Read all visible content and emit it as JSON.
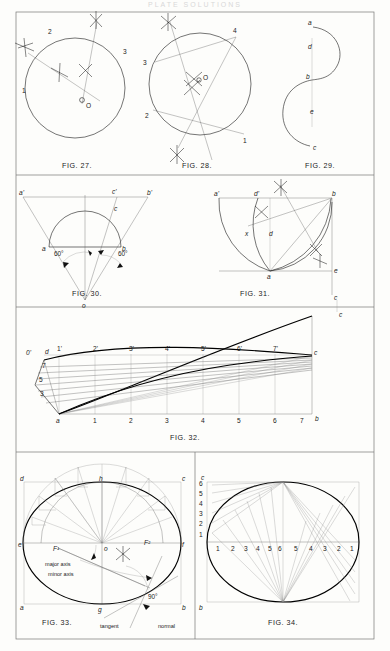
{
  "page": {
    "header": "PLATE SOLUTIONS",
    "background": "#fdfdfb",
    "ink": "#1a1a1a",
    "width": 390,
    "height": 651
  },
  "figures": [
    {
      "id": "fig27",
      "caption": "FIG. 27.",
      "topic": "circle through three given points",
      "labels": [
        "1",
        "2",
        "3",
        "O"
      ]
    },
    {
      "id": "fig28",
      "caption": "FIG. 28.",
      "topic": "centre of circle from four chord points",
      "labels": [
        "1",
        "2",
        "3",
        "4",
        "O"
      ]
    },
    {
      "id": "fig29",
      "caption": "FIG. 29.",
      "topic": "reverse (ogee) curve joining two lines",
      "labels": [
        "a",
        "d",
        "b",
        "e",
        "c"
      ]
    },
    {
      "id": "fig30",
      "caption": "FIG. 30.",
      "topic": "enlargement of a semicircle by radial projection",
      "labels": [
        "a'",
        "c'",
        "b'",
        "a",
        "c",
        "b",
        "o"
      ],
      "angles": [
        "60°",
        "60°"
      ]
    },
    {
      "id": "fig31",
      "caption": "FIG. 31.",
      "topic": "quadrant arc construction with bisectors",
      "labels": [
        "a'",
        "d'",
        "b",
        "x",
        "d",
        "a",
        "e",
        "c"
      ]
    },
    {
      "id": "fig32",
      "caption": "FIG. 32.",
      "topic": "development of a curved transition surface",
      "bottom_labels": [
        "a",
        "1",
        "2",
        "3",
        "4",
        "5",
        "6",
        "7",
        "b"
      ],
      "top_labels": [
        "0'",
        "1'",
        "2'",
        "3'",
        "4'",
        "5'",
        "6'",
        "7'",
        "c"
      ],
      "left_labels": [
        "d",
        "7",
        "5",
        "3"
      ],
      "extra_labels": [
        "c"
      ]
    },
    {
      "id": "fig33",
      "caption": "FIG. 33.",
      "topic": "ellipse by concentric-circle method, with tangent and normal",
      "labels": [
        "d",
        "h",
        "c",
        "e",
        "F¹",
        "o",
        "F²",
        "f",
        "a",
        "g",
        "b"
      ],
      "annotations": [
        "major axis",
        "minor axis",
        "tangent",
        "normal",
        "90°"
      ]
    },
    {
      "id": "fig34",
      "caption": "FIG. 34.",
      "topic": "ellipse by intersecting lines (rectangle method)",
      "corner_labels": [
        "c",
        "b"
      ],
      "left_scale": [
        "6",
        "5",
        "4",
        "3",
        "2",
        "1"
      ],
      "bottom_scale_left": [
        "1",
        "2",
        "3",
        "4",
        "5",
        "6"
      ],
      "bottom_scale_right": [
        "5",
        "4",
        "3",
        "2",
        "1"
      ]
    }
  ]
}
